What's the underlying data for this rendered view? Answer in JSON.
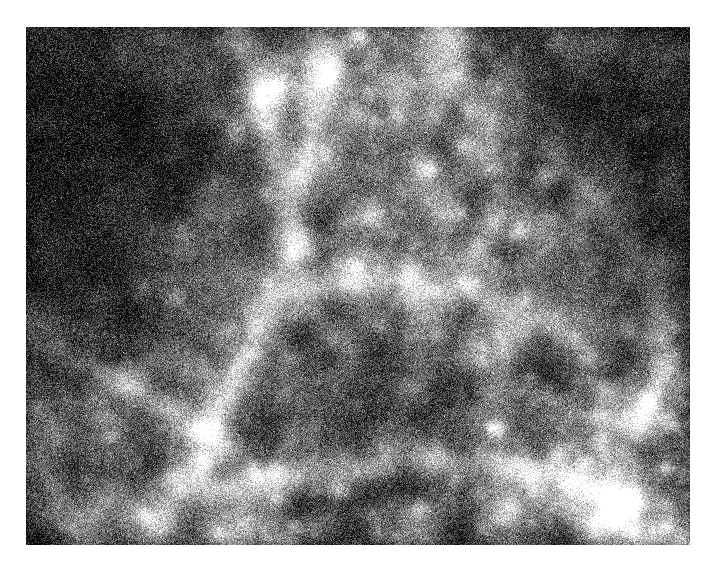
{
  "page": {
    "background_color": "#ffffff",
    "width": 716,
    "height": 571
  },
  "figure": {
    "name": "cosmic-web-field",
    "x": 26,
    "y": 27,
    "width": 664,
    "height": 518,
    "colormap": "greyscale",
    "background_color": "#0b0b0b",
    "mean_level_color": "#3a3a3a",
    "peak_color": "#f2f2f2",
    "border": "none",
    "caption": "",
    "axis_labels_visible": false,
    "colorbar_visible": false,
    "tick_marks_visible": false
  },
  "chart_data": {
    "type": "heatmap",
    "title": "",
    "subtitle": "",
    "xlabel": "",
    "ylabel": "",
    "legend_position": "none",
    "grid": false,
    "xlim": [
      0,
      664
    ],
    "ylim": [
      0,
      518
    ],
    "value_range": [
      0,
      255
    ],
    "colormap": "grey",
    "background_level": 18,
    "noise": {
      "type": "gaussian-pixel-grain",
      "amplitude": 34,
      "grain_size_px": 2,
      "seed": 20240517
    },
    "description": "Noisy greyscale intensity map of a cosmological density field showing filamentary cosmic-web structure, compact bright halos and dark void regions.",
    "voids": [
      {
        "name": "void-top-left",
        "cx": 70,
        "cy": 80,
        "rx": 150,
        "ry": 170,
        "depth": 0.8
      },
      {
        "name": "void-upper-left",
        "cx": 40,
        "cy": 250,
        "rx": 110,
        "ry": 150,
        "depth": 0.7
      },
      {
        "name": "void-top-right",
        "cx": 600,
        "cy": 70,
        "rx": 170,
        "ry": 130,
        "depth": 0.72
      },
      {
        "name": "void-right-upper",
        "cx": 660,
        "cy": 210,
        "rx": 120,
        "ry": 120,
        "depth": 0.55
      },
      {
        "name": "void-centre",
        "cx": 330,
        "cy": 360,
        "rx": 115,
        "ry": 110,
        "depth": 0.58
      },
      {
        "name": "void-centre-upper",
        "cx": 280,
        "cy": 175,
        "rx": 70,
        "ry": 80,
        "depth": 0.45
      },
      {
        "name": "void-lower-left",
        "cx": 110,
        "cy": 470,
        "rx": 110,
        "ry": 90,
        "depth": 0.4
      },
      {
        "name": "void-bottom-mid",
        "cx": 395,
        "cy": 490,
        "rx": 90,
        "ry": 70,
        "depth": 0.35
      },
      {
        "name": "void-mid-right",
        "cx": 520,
        "cy": 300,
        "rx": 60,
        "ry": 70,
        "depth": 0.3
      }
    ],
    "filaments": [
      {
        "name": "filament-nw-diagonal",
        "points": [
          [
            215,
            0
          ],
          [
            232,
            60
          ],
          [
            250,
            130
          ],
          [
            262,
            205
          ],
          [
            250,
            270
          ],
          [
            220,
            330
          ],
          [
            180,
            400
          ],
          [
            150,
            470
          ],
          [
            130,
            518
          ]
        ],
        "width": 30,
        "brightness": 0.62
      },
      {
        "name": "filament-upper-spine",
        "points": [
          [
            300,
            18
          ],
          [
            286,
            90
          ],
          [
            272,
            160
          ],
          [
            268,
            230
          ],
          [
            290,
            290
          ],
          [
            330,
            330
          ]
        ],
        "width": 22,
        "brightness": 0.52
      },
      {
        "name": "filament-central-bridge",
        "points": [
          [
            250,
            268
          ],
          [
            320,
            252
          ],
          [
            390,
            250
          ],
          [
            450,
            268
          ],
          [
            510,
            292
          ],
          [
            560,
            320
          ]
        ],
        "width": 24,
        "brightness": 0.55
      },
      {
        "name": "filament-ne-arc",
        "points": [
          [
            430,
            30
          ],
          [
            455,
            85
          ],
          [
            470,
            140
          ],
          [
            466,
            200
          ],
          [
            440,
            250
          ]
        ],
        "width": 20,
        "brightness": 0.48
      },
      {
        "name": "filament-right-chain",
        "points": [
          [
            520,
            120
          ],
          [
            560,
            160
          ],
          [
            600,
            210
          ],
          [
            630,
            265
          ],
          [
            640,
            330
          ],
          [
            620,
            395
          ]
        ],
        "width": 22,
        "brightness": 0.5
      },
      {
        "name": "filament-lower-sweep",
        "points": [
          [
            150,
            470
          ],
          [
            230,
            455
          ],
          [
            320,
            440
          ],
          [
            405,
            432
          ],
          [
            480,
            440
          ],
          [
            550,
            460
          ],
          [
            620,
            480
          ]
        ],
        "width": 26,
        "brightness": 0.5
      },
      {
        "name": "filament-sw-branch",
        "points": [
          [
            40,
            330
          ],
          [
            90,
            352
          ],
          [
            140,
            378
          ],
          [
            190,
            412
          ],
          [
            230,
            450
          ]
        ],
        "width": 22,
        "brightness": 0.58
      },
      {
        "name": "filament-mid-left-stub",
        "points": [
          [
            0,
            290
          ],
          [
            55,
            300
          ],
          [
            110,
            312
          ]
        ],
        "width": 18,
        "brightness": 0.42
      },
      {
        "name": "filament-ring-right",
        "points": [
          [
            470,
            350
          ],
          [
            520,
            372
          ],
          [
            570,
            390
          ],
          [
            620,
            400
          ]
        ],
        "width": 18,
        "brightness": 0.44
      },
      {
        "name": "filament-bottom-right",
        "points": [
          [
            520,
            470
          ],
          [
            570,
            495
          ],
          [
            620,
            510
          ],
          [
            664,
            516
          ]
        ],
        "width": 20,
        "brightness": 0.45
      }
    ],
    "halos": [
      {
        "name": "halo-01",
        "cx": 277,
        "cy": 216,
        "r": 12,
        "peak": 1.0
      },
      {
        "name": "halo-02",
        "cx": 103,
        "cy": 352,
        "r": 14,
        "peak": 0.96
      },
      {
        "name": "halo-03",
        "cx": 590,
        "cy": 479,
        "r": 13,
        "peak": 0.92
      },
      {
        "name": "halo-04",
        "cx": 345,
        "cy": 188,
        "r": 10,
        "peak": 0.85
      },
      {
        "name": "halo-05",
        "cx": 383,
        "cy": 239,
        "r": 9,
        "peak": 0.78
      },
      {
        "name": "halo-06",
        "cx": 264,
        "cy": 332,
        "r": 10,
        "peak": 0.8
      },
      {
        "name": "halo-07",
        "cx": 440,
        "cy": 118,
        "r": 9,
        "peak": 0.74
      },
      {
        "name": "halo-08",
        "cx": 516,
        "cy": 146,
        "r": 8,
        "peak": 0.72
      },
      {
        "name": "halo-09",
        "cx": 553,
        "cy": 186,
        "r": 8,
        "peak": 0.7
      },
      {
        "name": "halo-10",
        "cx": 611,
        "cy": 97,
        "r": 8,
        "peak": 0.68
      },
      {
        "name": "halo-11",
        "cx": 178,
        "cy": 439,
        "r": 9,
        "peak": 0.7
      },
      {
        "name": "halo-12",
        "cx": 249,
        "cy": 443,
        "r": 8,
        "peak": 0.66
      },
      {
        "name": "halo-13",
        "cx": 313,
        "cy": 462,
        "r": 8,
        "peak": 0.64
      },
      {
        "name": "halo-14",
        "cx": 150,
        "cy": 270,
        "r": 8,
        "peak": 0.62
      },
      {
        "name": "halo-15",
        "cx": 209,
        "cy": 110,
        "r": 7,
        "peak": 0.58
      },
      {
        "name": "halo-16",
        "cx": 253,
        "cy": 58,
        "r": 7,
        "peak": 0.6
      },
      {
        "name": "halo-17",
        "cx": 304,
        "cy": 50,
        "r": 7,
        "peak": 0.56
      },
      {
        "name": "halo-18",
        "cx": 372,
        "cy": 88,
        "r": 7,
        "peak": 0.58
      },
      {
        "name": "halo-19",
        "cx": 470,
        "cy": 62,
        "r": 7,
        "peak": 0.54
      },
      {
        "name": "halo-20",
        "cx": 500,
        "cy": 270,
        "r": 8,
        "peak": 0.62
      },
      {
        "name": "halo-21",
        "cx": 560,
        "cy": 332,
        "r": 8,
        "peak": 0.6
      },
      {
        "name": "halo-22",
        "cx": 620,
        "cy": 372,
        "r": 7,
        "peak": 0.56
      },
      {
        "name": "halo-23",
        "cx": 640,
        "cy": 440,
        "r": 7,
        "peak": 0.58
      },
      {
        "name": "halo-24",
        "cx": 470,
        "cy": 400,
        "r": 8,
        "peak": 0.58
      },
      {
        "name": "halo-25",
        "cx": 412,
        "cy": 308,
        "r": 7,
        "peak": 0.54
      },
      {
        "name": "halo-26",
        "cx": 355,
        "cy": 297,
        "r": 7,
        "peak": 0.52
      },
      {
        "name": "halo-27",
        "cx": 205,
        "cy": 300,
        "r": 7,
        "peak": 0.52
      },
      {
        "name": "halo-28",
        "cx": 84,
        "cy": 410,
        "r": 7,
        "peak": 0.54
      },
      {
        "name": "halo-29",
        "cx": 35,
        "cy": 318,
        "r": 7,
        "peak": 0.5
      },
      {
        "name": "halo-30",
        "cx": 120,
        "cy": 488,
        "r": 7,
        "peak": 0.5
      },
      {
        "name": "halo-31",
        "cx": 392,
        "cy": 480,
        "r": 7,
        "peak": 0.52
      },
      {
        "name": "halo-32",
        "cx": 455,
        "cy": 503,
        "r": 6,
        "peak": 0.48
      },
      {
        "name": "halo-33",
        "cx": 530,
        "cy": 430,
        "r": 7,
        "peak": 0.52
      },
      {
        "name": "halo-34",
        "cx": 600,
        "cy": 245,
        "r": 7,
        "peak": 0.5
      },
      {
        "name": "halo-35",
        "cx": 648,
        "cy": 300,
        "r": 6,
        "peak": 0.46
      },
      {
        "name": "halo-36",
        "cx": 300,
        "cy": 130,
        "r": 6,
        "peak": 0.46
      },
      {
        "name": "halo-37",
        "cx": 238,
        "cy": 165,
        "r": 6,
        "peak": 0.44
      },
      {
        "name": "halo-38",
        "cx": 330,
        "cy": 238,
        "r": 6,
        "peak": 0.46
      },
      {
        "name": "halo-39",
        "cx": 436,
        "cy": 186,
        "r": 6,
        "peak": 0.44
      },
      {
        "name": "halo-40",
        "cx": 488,
        "cy": 208,
        "r": 6,
        "peak": 0.44
      },
      {
        "name": "halo-41",
        "cx": 160,
        "cy": 346,
        "r": 6,
        "peak": 0.46
      },
      {
        "name": "halo-42",
        "cx": 222,
        "cy": 392,
        "r": 6,
        "peak": 0.44
      },
      {
        "name": "halo-43",
        "cx": 288,
        "cy": 400,
        "r": 6,
        "peak": 0.42
      },
      {
        "name": "halo-44",
        "cx": 356,
        "cy": 420,
        "r": 6,
        "peak": 0.42
      },
      {
        "name": "halo-45",
        "cx": 430,
        "cy": 452,
        "r": 6,
        "peak": 0.42
      },
      {
        "name": "halo-46",
        "cx": 505,
        "cy": 350,
        "r": 6,
        "peak": 0.42
      },
      {
        "name": "halo-47",
        "cx": 575,
        "cy": 410,
        "r": 6,
        "peak": 0.42
      },
      {
        "name": "halo-48",
        "cx": 62,
        "cy": 452,
        "r": 6,
        "peak": 0.42
      },
      {
        "name": "halo-49",
        "cx": 190,
        "cy": 505,
        "r": 6,
        "peak": 0.4
      },
      {
        "name": "halo-50",
        "cx": 268,
        "cy": 498,
        "r": 6,
        "peak": 0.4
      },
      {
        "name": "halo-51",
        "cx": 352,
        "cy": 508,
        "r": 6,
        "peak": 0.4
      },
      {
        "name": "halo-52",
        "cx": 610,
        "cy": 150,
        "r": 6,
        "peak": 0.44
      },
      {
        "name": "halo-53",
        "cx": 548,
        "cy": 62,
        "r": 6,
        "peak": 0.42
      },
      {
        "name": "halo-54",
        "cx": 404,
        "cy": 142,
        "r": 6,
        "peak": 0.42
      },
      {
        "name": "halo-55",
        "cx": 268,
        "cy": 288,
        "r": 6,
        "peak": 0.44
      },
      {
        "name": "halo-56",
        "cx": 455,
        "cy": 330,
        "r": 6,
        "peak": 0.42
      },
      {
        "name": "halo-57",
        "cx": 128,
        "cy": 204,
        "r": 6,
        "peak": 0.4
      },
      {
        "name": "halo-58",
        "cx": 88,
        "cy": 160,
        "r": 5,
        "peak": 0.36
      },
      {
        "name": "halo-59",
        "cx": 640,
        "cy": 500,
        "r": 6,
        "peak": 0.42
      },
      {
        "name": "halo-60",
        "cx": 48,
        "cy": 505,
        "r": 5,
        "peak": 0.36
      },
      {
        "name": "halo-61",
        "cx": 335,
        "cy": 12,
        "r": 6,
        "peak": 0.46
      },
      {
        "name": "halo-62",
        "cx": 215,
        "cy": 20,
        "r": 5,
        "peak": 0.38
      },
      {
        "name": "halo-63",
        "cx": 660,
        "cy": 60,
        "r": 5,
        "peak": 0.36
      },
      {
        "name": "halo-64",
        "cx": 12,
        "cy": 380,
        "r": 5,
        "peak": 0.38
      }
    ]
  }
}
